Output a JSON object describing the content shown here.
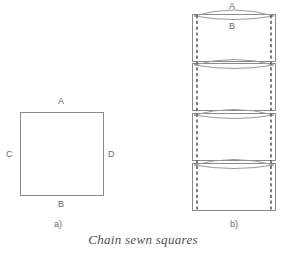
{
  "figure": {
    "caption": "Chain sewn squares",
    "panels": [
      {
        "id": "a",
        "label": "a)"
      },
      {
        "id": "b",
        "label": "b)"
      }
    ]
  },
  "diagram_a": {
    "name": "flat-square",
    "edge_labels": {
      "top": "A",
      "bottom": "B",
      "left": "C",
      "right": "D"
    },
    "geometry": {
      "x": 20,
      "y": 112,
      "width": 84,
      "height": 84,
      "stroke": "#8a8a8a"
    }
  },
  "diagram_b": {
    "name": "chain-sewn-stack",
    "edge_labels": {
      "top_seam": "A",
      "panel_top": "B"
    },
    "geometry": {
      "left": 192,
      "right": 276,
      "dashed_left": 197,
      "dashed_right": 271,
      "stroke": "#8a8a8a",
      "dash_stroke": "#5f5f5f"
    },
    "panels": [
      {
        "index": 1,
        "top": 14,
        "bottom": 62
      },
      {
        "index": 2,
        "top": 63,
        "bottom": 111
      },
      {
        "index": 3,
        "top": 113,
        "bottom": 161
      },
      {
        "index": 4,
        "top": 163,
        "bottom": 211
      }
    ],
    "seam_count": 4
  },
  "colors": {
    "line": "#8a8a8a",
    "dashed": "#5f5f5f",
    "text": "#6b6b6b",
    "caption": "#4f4f4f",
    "background": "#ffffff"
  }
}
